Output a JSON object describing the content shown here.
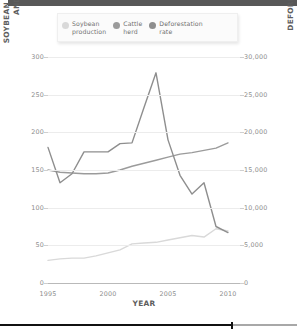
{
  "top_bar": {
    "name": "header-bar",
    "color": "#585858"
  },
  "legend": {
    "position": "top",
    "items": [
      {
        "label": "Soybean\nproduction",
        "color": "#d9d9d9",
        "key": "soybean"
      },
      {
        "label": "Cattle\nherd",
        "color": "#9b9b9b",
        "key": "cattle"
      },
      {
        "label": "Deforestation\nrate",
        "color": "#8e8e8e",
        "key": "deforestation"
      }
    ]
  },
  "axes": {
    "xlabel": "YEAR",
    "ylabel_left": [
      "SOYBEAN PRODUCTION (MILLION METRIC TONS)",
      "AND CATTLE HERD (MILLION HEAD)"
    ],
    "ylabel_right": "DEFORESTATION RATE (KM²/YEAR)",
    "xticks": [
      "1995",
      "2000",
      "2005",
      "2010"
    ],
    "yticks_left": [
      "0",
      "50",
      "100",
      "150",
      "200",
      "250",
      "300"
    ],
    "yticks_right": [
      "0",
      "5,000",
      "10,000",
      "15,000",
      "20,000",
      "25,000",
      "30,000"
    ]
  },
  "scrubber": {
    "progress_percent": 78,
    "fill_color": "#111111",
    "track_color": "#a8a8a8"
  },
  "chart_data": {
    "type": "line",
    "title": "",
    "xlabel": "YEAR",
    "ylabel": "SOYBEAN PRODUCTION (MILLION METRIC TONS) AND CATTLE HERD (MILLION HEAD)",
    "ylabel_secondary": "DEFORESTATION RATE (KM²/YEAR)",
    "xlim": [
      1995,
      2011
    ],
    "ylim": [
      0,
      300
    ],
    "ylim_secondary": [
      0,
      30000
    ],
    "xticks": [
      1995,
      2000,
      2005,
      2010
    ],
    "yticks": [
      0,
      50,
      100,
      150,
      200,
      250,
      300
    ],
    "yticks_secondary": [
      0,
      5000,
      10000,
      15000,
      20000,
      25000,
      30000
    ],
    "grid": true,
    "legend_position": "top",
    "x": [
      1995,
      1996,
      1997,
      1998,
      1999,
      2000,
      2001,
      2002,
      2003,
      2004,
      2005,
      2006,
      2007,
      2008,
      2009,
      2010
    ],
    "series": [
      {
        "name": "Soybean production",
        "axis": "left",
        "unit": "million metric tons",
        "color": "#d9d9d9",
        "values": [
          30,
          32,
          33,
          33,
          36,
          40,
          44,
          52,
          53,
          54,
          57,
          60,
          63,
          61,
          72,
          69
        ]
      },
      {
        "name": "Cattle herd",
        "axis": "left",
        "unit": "million head",
        "color": "#9b9b9b",
        "values": [
          150,
          147,
          146,
          145,
          145,
          146,
          150,
          155,
          159,
          163,
          167,
          171,
          173,
          176,
          179,
          186
        ]
      },
      {
        "name": "Deforestation rate",
        "axis": "right",
        "unit": "km²/year",
        "color": "#8e8e8e",
        "values": [
          18000,
          13300,
          14500,
          17400,
          17400,
          17400,
          18500,
          18600,
          23300,
          27900,
          19000,
          14300,
          11800,
          13300,
          7500,
          6700
        ]
      }
    ]
  }
}
